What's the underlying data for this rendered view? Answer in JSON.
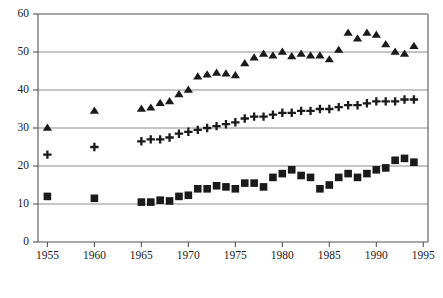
{
  "chart_data": {
    "type": "scatter",
    "title": "",
    "subtitle": "",
    "xlabel": "",
    "ylabel": "",
    "xlim": [
      1954,
      1995.5
    ],
    "ylim": [
      0,
      60
    ],
    "xticks": [
      1955,
      1960,
      1965,
      1970,
      1975,
      1980,
      1985,
      1990,
      1995
    ],
    "yticks": [
      0,
      10,
      20,
      30,
      40,
      50,
      60
    ],
    "grid": "horizontal",
    "legend": "none",
    "marker_color": "#1a1a1a",
    "series": [
      {
        "name": "triangle-series",
        "marker": "triangle",
        "x": [
          1955,
          1960,
          1965,
          1966,
          1967,
          1968,
          1969,
          1970,
          1971,
          1972,
          1973,
          1974,
          1975,
          1976,
          1977,
          1978,
          1979,
          1980,
          1981,
          1982,
          1983,
          1984,
          1985,
          1986,
          1987,
          1988,
          1989,
          1990,
          1991,
          1992,
          1993,
          1994
        ],
        "values": [
          30.0,
          34.5,
          35.0,
          35.3,
          36.5,
          37.0,
          38.8,
          40.0,
          43.5,
          44.0,
          44.5,
          44.3,
          43.8,
          47.0,
          48.5,
          49.5,
          49.0,
          50.0,
          48.8,
          49.5,
          49.0,
          49.0,
          48.0,
          50.5,
          55.0,
          53.5,
          55.0,
          54.5,
          52.0,
          50.0,
          49.5,
          51.5
        ]
      },
      {
        "name": "plus-series",
        "marker": "plus",
        "x": [
          1955,
          1960,
          1965,
          1966,
          1967,
          1968,
          1969,
          1970,
          1971,
          1972,
          1973,
          1974,
          1975,
          1976,
          1977,
          1978,
          1979,
          1980,
          1981,
          1982,
          1983,
          1984,
          1985,
          1986,
          1987,
          1988,
          1989,
          1990,
          1991,
          1992,
          1993,
          1994
        ],
        "values": [
          23.0,
          25.0,
          26.5,
          27.0,
          27.0,
          27.5,
          28.5,
          29.0,
          29.5,
          30.0,
          30.5,
          31.0,
          31.5,
          32.5,
          33.0,
          33.0,
          33.5,
          34.0,
          34.0,
          34.5,
          34.5,
          35.0,
          35.0,
          35.5,
          36.0,
          36.0,
          36.5,
          37.0,
          37.0,
          37.0,
          37.5,
          37.5
        ]
      },
      {
        "name": "square-series",
        "marker": "square",
        "x": [
          1955,
          1960,
          1965,
          1966,
          1967,
          1968,
          1969,
          1970,
          1971,
          1972,
          1973,
          1974,
          1975,
          1976,
          1977,
          1978,
          1979,
          1980,
          1981,
          1982,
          1983,
          1984,
          1985,
          1986,
          1987,
          1988,
          1989,
          1990,
          1991,
          1992,
          1993,
          1994
        ],
        "values": [
          12.0,
          11.5,
          10.5,
          10.5,
          11.0,
          10.8,
          12.0,
          12.3,
          14.0,
          14.0,
          14.8,
          14.5,
          14.0,
          15.5,
          15.5,
          14.5,
          17.0,
          18.0,
          19.0,
          17.5,
          17.0,
          14.0,
          15.0,
          17.0,
          18.0,
          17.0,
          18.0,
          19.0,
          19.5,
          21.5,
          22.0,
          21.0
        ]
      }
    ]
  }
}
